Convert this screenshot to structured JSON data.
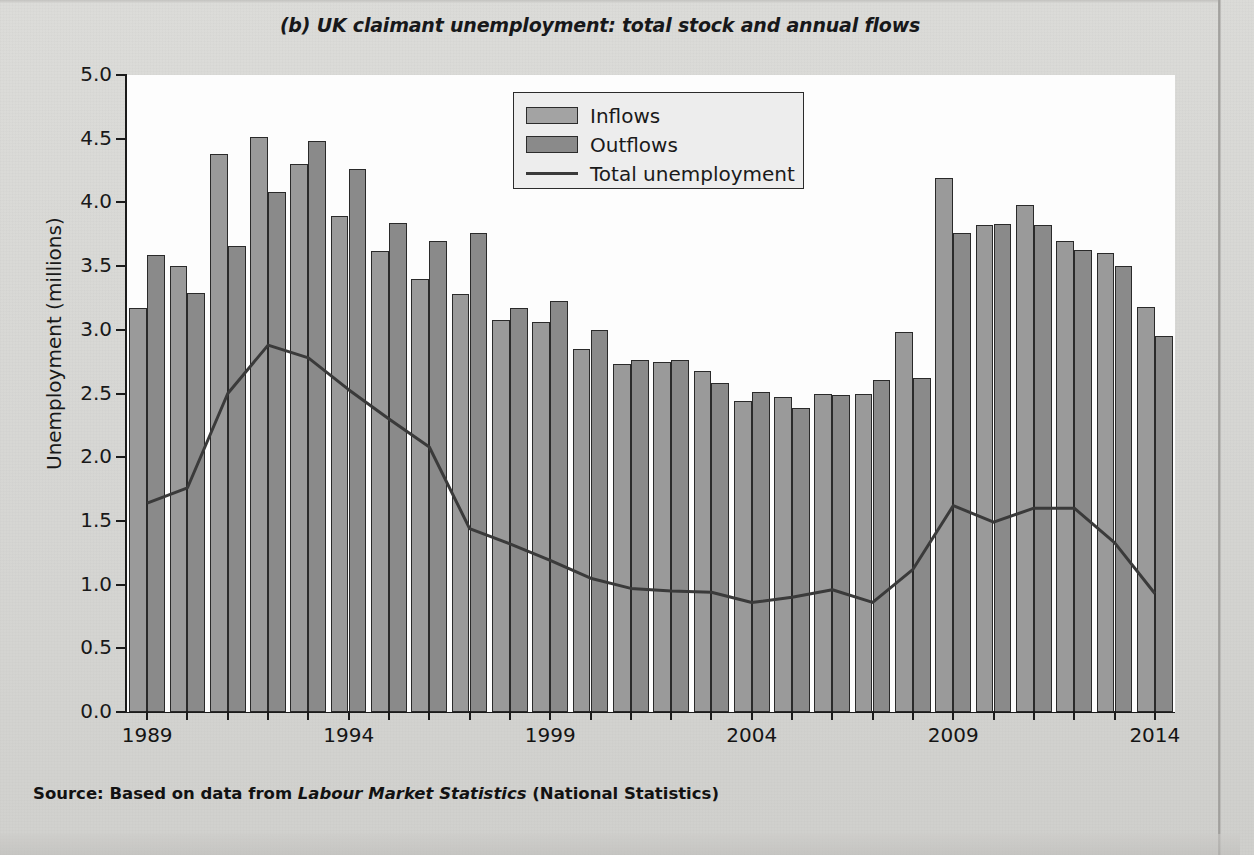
{
  "figure": {
    "title": "(b) UK claimant unemployment: total stock and annual flows",
    "source_prefix": "Source: Based on data from ",
    "source_italic": "Labour Market Statistics",
    "source_suffix": " (National Statistics)"
  },
  "legend": {
    "position": "top-center",
    "items": [
      {
        "label": "Inflows",
        "marker": "filled-rect",
        "color": "#a3a3a3"
      },
      {
        "label": "Outflows",
        "marker": "filled-rect",
        "color": "#8a8a8a"
      },
      {
        "label": "Total unemployment",
        "marker": "line",
        "color": "#3a3a3a"
      }
    ]
  },
  "colors": {
    "inflow_fill": "#9a9a9a",
    "outflow_fill": "#8a8a8a",
    "bar_stroke": "#2a2a2a",
    "line": "#3a3a3a",
    "plot_background": "#fdfdfd",
    "page_background": "#d9d9d6",
    "axis": "#1b1b1b"
  },
  "chart_data": {
    "type": "bar",
    "title": "(b) UK claimant unemployment: total stock and annual flows",
    "xlabel": "",
    "ylabel": "Unemployment (millions)",
    "ylim": [
      0.0,
      5.0
    ],
    "ytick_labels": [
      "0.0",
      "0.5",
      "1.0",
      "1.5",
      "2.0",
      "2.5",
      "3.0",
      "3.5",
      "4.0",
      "4.5",
      "5.0"
    ],
    "ytick_values": [
      0.0,
      0.5,
      1.0,
      1.5,
      2.0,
      2.5,
      3.0,
      3.5,
      4.0,
      4.5,
      5.0
    ],
    "grid": false,
    "legend_position": "top-center",
    "categories": [
      "1989",
      "1990",
      "1991",
      "1992",
      "1993",
      "1994",
      "1995",
      "1996",
      "1997",
      "1998",
      "1999",
      "2000",
      "2001",
      "2002",
      "2003",
      "2004",
      "2005",
      "2006",
      "2007",
      "2008",
      "2009",
      "2010",
      "2011",
      "2012",
      "2013",
      "2014"
    ],
    "xtick_labels": [
      "1989",
      "1994",
      "1999",
      "2004",
      "2009",
      "2014"
    ],
    "xtick_categories": [
      "1989",
      "1994",
      "1999",
      "2004",
      "2009",
      "2014"
    ],
    "series": [
      {
        "name": "Inflows",
        "type": "bar",
        "values": [
          3.17,
          3.5,
          4.38,
          4.51,
          4.3,
          3.89,
          3.62,
          3.4,
          3.28,
          3.08,
          3.06,
          2.85,
          2.73,
          2.75,
          2.68,
          2.44,
          2.47,
          2.5,
          2.5,
          2.98,
          4.19,
          3.82,
          3.98,
          3.7,
          3.6,
          3.18
        ]
      },
      {
        "name": "Outflows",
        "type": "bar",
        "values": [
          3.59,
          3.29,
          3.66,
          4.08,
          4.48,
          4.26,
          3.84,
          3.7,
          3.76,
          3.17,
          3.23,
          3.0,
          2.76,
          2.76,
          2.58,
          2.51,
          2.39,
          2.49,
          2.61,
          2.62,
          3.76,
          3.83,
          3.82,
          3.63,
          3.5,
          2.95
        ]
      },
      {
        "name": "Total unemployment",
        "type": "line",
        "values": [
          1.64,
          1.76,
          2.5,
          2.88,
          2.78,
          2.53,
          2.3,
          2.08,
          1.44,
          1.32,
          1.19,
          1.05,
          0.97,
          0.95,
          0.94,
          0.86,
          0.9,
          0.96,
          0.86,
          1.12,
          1.62,
          1.49,
          1.6,
          1.6,
          1.33,
          0.93
        ]
      }
    ]
  }
}
